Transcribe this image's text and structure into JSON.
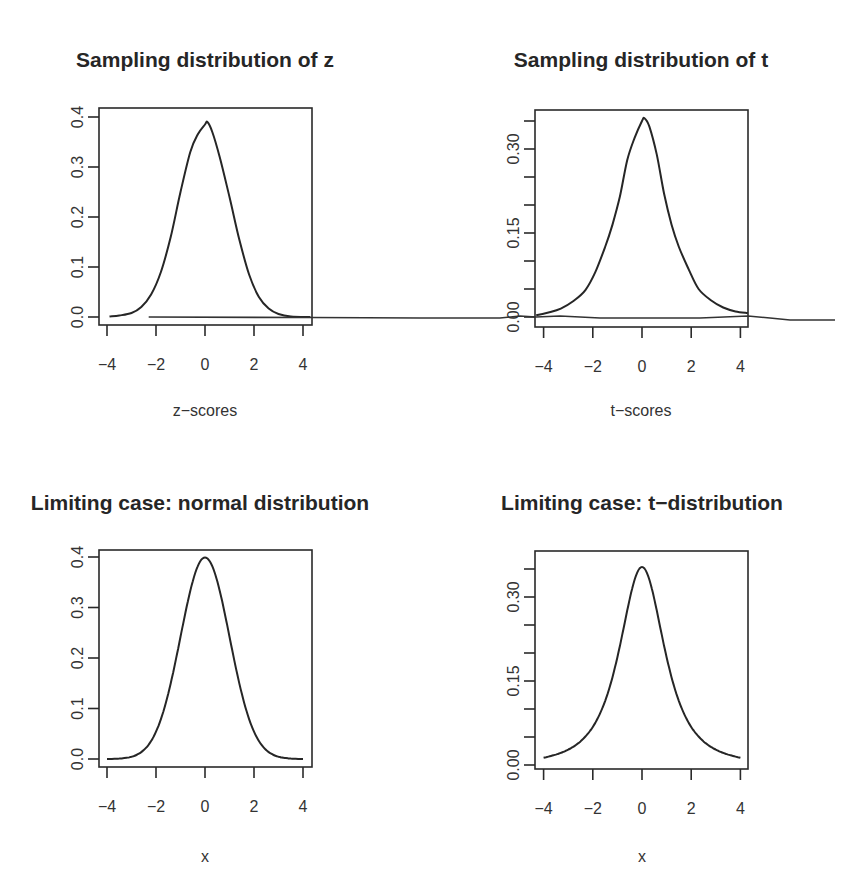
{
  "figure": {
    "panels": [
      {
        "id": "p1",
        "title": "Sampling distribution of z",
        "xlabel": "z−scores",
        "ylabel": "",
        "x_ticks": [
          "−4",
          "−2",
          "0",
          "2",
          "4"
        ],
        "y_ticks": [
          "0.0",
          "0.1",
          "0.2",
          "0.3",
          "0.4"
        ]
      },
      {
        "id": "p2",
        "title": "Sampling distribution of t",
        "xlabel": "t−scores",
        "ylabel": "",
        "x_ticks": [
          "−4",
          "−2",
          "0",
          "2",
          "4"
        ],
        "y_ticks": [
          "0.00",
          "0.15",
          "0.30"
        ]
      },
      {
        "id": "p3",
        "title": "Limiting case: normal distribution",
        "xlabel": "x",
        "ylabel": "",
        "x_ticks": [
          "−4",
          "−2",
          "0",
          "2",
          "4"
        ],
        "y_ticks": [
          "0.0",
          "0.1",
          "0.2",
          "0.3",
          "0.4"
        ]
      },
      {
        "id": "p4",
        "title": "Limiting case: t−distribution",
        "xlabel": "x",
        "ylabel": "",
        "x_ticks": [
          "−4",
          "−2",
          "0",
          "2",
          "4"
        ],
        "y_ticks": [
          "0.00",
          "0.15",
          "0.30"
        ]
      }
    ]
  },
  "chart_data": [
    {
      "type": "line",
      "title": "Sampling distribution of z",
      "xlabel": "z-scores",
      "ylabel": "Density",
      "xlim": [
        -4.3,
        4.3
      ],
      "ylim": [
        -0.015,
        0.405
      ],
      "x_ticks": [
        -4,
        -2,
        0,
        2,
        4
      ],
      "y_ticks": [
        0.0,
        0.1,
        0.2,
        0.3,
        0.4
      ],
      "grid": false,
      "series": [
        {
          "name": "empirical density of z",
          "x": [
            -3.9,
            -3.5,
            -3.0,
            -2.6,
            -2.2,
            -1.8,
            -1.4,
            -1.0,
            -0.6,
            -0.3,
            0.0,
            0.1,
            0.3,
            0.6,
            1.0,
            1.4,
            1.8,
            2.2,
            2.6,
            3.0,
            3.5,
            4.3
          ],
          "y": [
            0.001,
            0.003,
            0.008,
            0.02,
            0.045,
            0.09,
            0.16,
            0.25,
            0.33,
            0.365,
            0.385,
            0.39,
            0.37,
            0.32,
            0.24,
            0.155,
            0.085,
            0.04,
            0.017,
            0.006,
            0.001,
            0.0
          ]
        },
        {
          "name": "baseline line (unclipped)",
          "x": [
            -2.3,
            4.3,
            16.0
          ],
          "y": [
            0.0,
            -0.001,
            -0.003
          ]
        }
      ]
    },
    {
      "type": "line",
      "title": "Sampling distribution of t",
      "xlabel": "t-scores",
      "ylabel": "Density",
      "xlim": [
        -4.3,
        4.3
      ],
      "ylim": [
        -0.012,
        0.365
      ],
      "x_ticks": [
        -4,
        -2,
        0,
        2,
        4
      ],
      "y_ticks": [
        0.0,
        0.15,
        0.3
      ],
      "minor_y_ticks": [
        0.05,
        0.1,
        0.2,
        0.25,
        0.35
      ],
      "grid": false,
      "series": [
        {
          "name": "empirical density of t",
          "x": [
            -4.3,
            -3.8,
            -3.3,
            -2.8,
            -2.3,
            -1.9,
            -1.5,
            -1.2,
            -0.9,
            -0.6,
            -0.3,
            0.0,
            0.1,
            0.3,
            0.6,
            0.9,
            1.2,
            1.5,
            1.9,
            2.3,
            2.8,
            3.3,
            3.8,
            4.3
          ],
          "y": [
            0.003,
            0.008,
            0.015,
            0.028,
            0.048,
            0.08,
            0.125,
            0.165,
            0.215,
            0.28,
            0.32,
            0.35,
            0.355,
            0.34,
            0.29,
            0.22,
            0.165,
            0.125,
            0.085,
            0.05,
            0.03,
            0.017,
            0.01,
            0.007
          ]
        }
      ]
    },
    {
      "type": "line",
      "title": "Limiting case: normal distribution",
      "xlabel": "x",
      "ylabel": "Density",
      "xlim": [
        -4.3,
        4.3
      ],
      "ylim": [
        -0.015,
        0.415
      ],
      "x_ticks": [
        -4,
        -2,
        0,
        2,
        4
      ],
      "y_ticks": [
        0.0,
        0.1,
        0.2,
        0.3,
        0.4
      ],
      "grid": false,
      "series": [
        {
          "name": "dnorm(x)",
          "function": "normal",
          "mean": 0,
          "sd": 1,
          "x_range": [
            -4,
            4
          ]
        }
      ]
    },
    {
      "type": "line",
      "title": "Limiting case: t-distribution",
      "xlabel": "x",
      "ylabel": "Density",
      "xlim": [
        -4.3,
        4.3
      ],
      "ylim": [
        -0.012,
        0.378
      ],
      "x_ticks": [
        -4,
        -2,
        0,
        2,
        4
      ],
      "y_ticks": [
        0.0,
        0.15,
        0.3
      ],
      "minor_y_ticks": [
        0.05,
        0.1,
        0.2,
        0.25,
        0.35
      ],
      "grid": false,
      "series": [
        {
          "name": "dt(x, df=2)",
          "function": "student_t",
          "df": 2,
          "x_range": [
            -4,
            4
          ],
          "peak": 0.354
        }
      ]
    }
  ]
}
